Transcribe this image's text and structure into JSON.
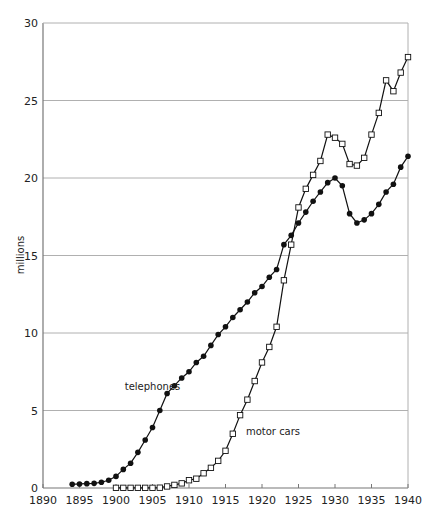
{
  "chart_data": {
    "type": "line",
    "title": "",
    "xlabel": "",
    "ylabel": "millions",
    "xlim": [
      1890,
      1940
    ],
    "ylim": [
      0,
      30
    ],
    "x_ticks": [
      1890,
      1895,
      1900,
      1905,
      1910,
      1915,
      1920,
      1925,
      1930,
      1935,
      1940
    ],
    "y_ticks": [
      0,
      5,
      10,
      15,
      20,
      25,
      30
    ],
    "grid": "horizontal",
    "legend": "inline labels",
    "series": [
      {
        "name": "telephones",
        "marker": "filled-circle",
        "label_pos": {
          "year": 1901.2,
          "value": 6.3
        },
        "x": [
          1894,
          1895,
          1896,
          1897,
          1898,
          1899,
          1900,
          1901,
          1902,
          1903,
          1904,
          1905,
          1906,
          1907,
          1908,
          1909,
          1910,
          1911,
          1912,
          1913,
          1914,
          1915,
          1916,
          1917,
          1918,
          1919,
          1920,
          1921,
          1922,
          1923,
          1924,
          1925,
          1926,
          1927,
          1928,
          1929,
          1930,
          1931,
          1932,
          1933,
          1934,
          1935,
          1936,
          1937,
          1938,
          1939,
          1940
        ],
        "values": [
          0.24,
          0.26,
          0.28,
          0.3,
          0.37,
          0.5,
          0.75,
          1.2,
          1.6,
          2.3,
          3.1,
          3.9,
          5.0,
          6.1,
          6.6,
          7.1,
          7.5,
          8.1,
          8.5,
          9.2,
          9.9,
          10.4,
          11.0,
          11.5,
          12.0,
          12.6,
          13.0,
          13.6,
          14.1,
          15.7,
          16.3,
          17.1,
          17.8,
          18.5,
          19.1,
          19.7,
          20.0,
          19.5,
          17.7,
          17.1,
          17.3,
          17.7,
          18.3,
          19.1,
          19.6,
          20.7,
          21.4
        ]
      },
      {
        "name": "motor cars",
        "marker": "open-square",
        "label_pos": {
          "year": 1917.8,
          "value": 3.4
        },
        "x": [
          1900,
          1901,
          1902,
          1903,
          1904,
          1905,
          1906,
          1907,
          1908,
          1909,
          1910,
          1911,
          1912,
          1913,
          1914,
          1915,
          1916,
          1917,
          1918,
          1919,
          1920,
          1921,
          1922,
          1923,
          1924,
          1925,
          1926,
          1927,
          1928,
          1929,
          1930,
          1931,
          1932,
          1933,
          1934,
          1935,
          1936,
          1937,
          1938,
          1939,
          1940
        ],
        "values": [
          0.01,
          0.01,
          0.01,
          0.01,
          0.01,
          0.01,
          0.02,
          0.1,
          0.2,
          0.3,
          0.5,
          0.6,
          0.95,
          1.3,
          1.75,
          2.4,
          3.5,
          4.7,
          5.7,
          6.9,
          8.1,
          9.1,
          10.4,
          13.4,
          15.7,
          18.1,
          19.3,
          20.2,
          21.1,
          22.8,
          22.6,
          22.2,
          20.9,
          20.8,
          21.3,
          22.8,
          24.2,
          26.3,
          25.6,
          26.8,
          27.8
        ]
      }
    ]
  },
  "colors": {
    "line": "#111111",
    "gridline": "#b0b0b0",
    "axis": "#777777",
    "marker_fill_open": "#ffffff"
  }
}
